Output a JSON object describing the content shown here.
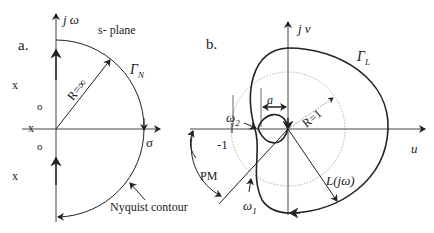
{
  "panel_a": {
    "label": "a.",
    "axis_y": "j ω",
    "axis_x": "σ",
    "plane_label": "s- plane",
    "contour_label": "Γ",
    "contour_sub": "N",
    "radius_label": "R=∞",
    "annotation": "Nyquist contour",
    "poles": [
      "x",
      "x",
      "x"
    ],
    "zeros": [
      "o",
      "o"
    ]
  },
  "panel_b": {
    "label": "b.",
    "axis_y": "j v",
    "axis_x": "u",
    "contour_label": "Γ",
    "contour_sub": "L",
    "unit_circle_label": "R=1",
    "distance_label": "a",
    "minus_one": "-1",
    "omega2": "ω",
    "omega2_sub": "2",
    "omega1": "ω",
    "omega1_sub": "1",
    "pm_label": "PM",
    "curve_label": "L(jω)"
  },
  "colors": {
    "stroke": "#222222",
    "dotted": "#999999"
  }
}
